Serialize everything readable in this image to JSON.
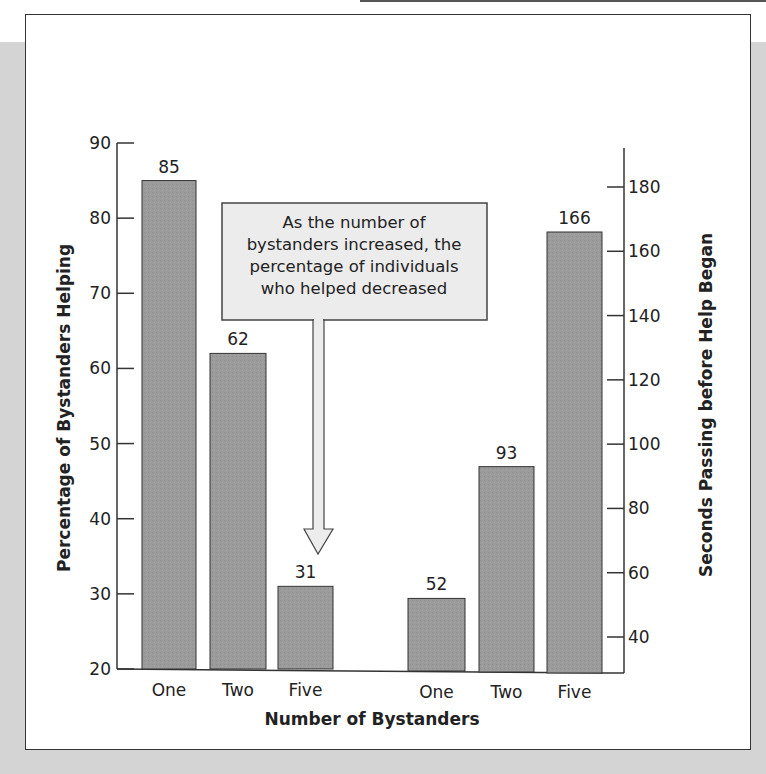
{
  "chart_data": [
    {
      "type": "bar",
      "title": "",
      "categories": [
        "One",
        "Two",
        "Five"
      ],
      "values": [
        85,
        62,
        31
      ],
      "xlabel": "Number of Bystanders",
      "ylabel": "Percentage of Bystanders Helping",
      "ylim": [
        20,
        90
      ],
      "yticks": [
        20,
        30,
        40,
        50,
        60,
        70,
        80,
        90
      ],
      "axis_side": "left",
      "grid": false,
      "annotation": "As the number of bystanders increased, the percentage of individuals who helped decreased"
    },
    {
      "type": "bar",
      "title": "",
      "categories": [
        "One",
        "Two",
        "Five"
      ],
      "values": [
        52,
        93,
        166
      ],
      "xlabel": "Number of Bystanders",
      "ylabel": "Seconds Passing before Help Began",
      "ylim": [
        30,
        190
      ],
      "yticks": [
        40,
        60,
        80,
        100,
        120,
        140,
        160,
        180
      ],
      "axis_side": "right",
      "grid": false,
      "annotation": "As the number of bystanders increased, the time elapsing before help was given increased"
    }
  ],
  "labels": {
    "xlabel": "Number of Bystanders",
    "left_ylabel": "Percentage of Bystanders Helping",
    "right_ylabel": "Seconds Passing before Help Began",
    "left_ticks": [
      "90",
      "80",
      "70",
      "60",
      "50",
      "40",
      "30",
      "20"
    ],
    "right_ticks": [
      "180",
      "160",
      "140",
      "120",
      "100",
      "80",
      "60",
      "40"
    ],
    "left_categories": [
      "One",
      "Two",
      "Five"
    ],
    "right_categories": [
      "One",
      "Two",
      "Five"
    ],
    "left_values": [
      "85",
      "62",
      "31"
    ],
    "right_values": [
      "52",
      "93",
      "166"
    ]
  },
  "callouts": {
    "helping": [
      "As the number of",
      "bystanders increased, the",
      "percentage of individuals",
      "who helped decreased"
    ],
    "time": [
      "As the number of bystanders",
      "increased, the time elapsing",
      "before help was given increased"
    ]
  },
  "colors": {
    "bar": "#999999",
    "bar_edge": "#333333",
    "callout_fill": "#ececec",
    "background": "#d4d4d4"
  }
}
